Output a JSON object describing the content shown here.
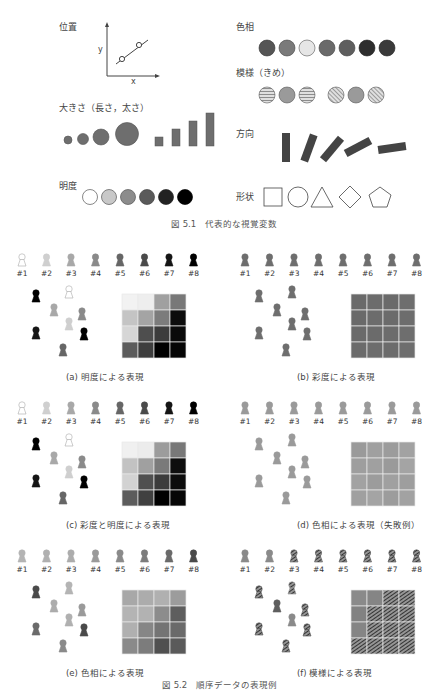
{
  "figure1": {
    "caption": "図 5.1　代表的な視覚変数",
    "labels": {
      "position": "位置",
      "size": "大きさ（長さ，太さ）",
      "lightness": "明度",
      "hue": "色相",
      "texture": "模様（きめ）",
      "orientation": "方向",
      "shape": "形状"
    },
    "axis": {
      "x": "x",
      "y": "y"
    },
    "hue_colors": [
      "#555555",
      "#7a7a7a",
      "#e6e6e6",
      "#6a6a6a",
      "#5e5e5e",
      "#2e2e2e",
      "#3a3a3a"
    ],
    "lightness_colors": [
      "#ffffff",
      "#c8c8c8",
      "#8c8c8c",
      "#5a5a5a",
      "#222222",
      "#000000"
    ]
  },
  "figure2": {
    "caption": "図 5.2　順序データの表現例",
    "ids": [
      "#1",
      "#2",
      "#3",
      "#4",
      "#5",
      "#6",
      "#7",
      "#8"
    ],
    "panels": [
      {
        "caption": "(a) 明度による表現",
        "icon_colors": [
          "#ffffff",
          "#cfcfcf",
          "#a8a8a8",
          "#8a8a8a",
          "#666666",
          "#4a4a4a",
          "#151515",
          "#000000"
        ],
        "grid": [
          "#f2f2f2",
          "#eeeeee",
          "#a0a0a0",
          "#787878",
          "#c4c4c4",
          "#a4a4a4",
          "#7c7c7c",
          "#0c0c0c",
          "#d6d6d6",
          "#4e4e4e",
          "#3c3c3c",
          "#0a0a0a",
          "#5c5c5c",
          "#3e3e3e",
          "#000000",
          "#050505"
        ]
      },
      {
        "caption": "(b) 彩度による表現",
        "icon_colors": [
          "#6e6e6e",
          "#6e6e6e",
          "#6e6e6e",
          "#6e6e6e",
          "#6e6e6e",
          "#6e6e6e",
          "#6e6e6e",
          "#6e6e6e"
        ],
        "grid": [
          "#6a6a6a",
          "#6c6c6c",
          "#6a6a6a",
          "#6e6e6e",
          "#6a6a6a",
          "#6c6c6c",
          "#6b6b6b",
          "#6d6d6d",
          "#6a6a6a",
          "#6b6b6b",
          "#6c6c6c",
          "#6e6e6e",
          "#6b6b6b",
          "#6d6d6d",
          "#6c6c6c",
          "#6e6e6e"
        ]
      },
      {
        "caption": "(c) 彩度と明度による表現",
        "icon_colors": [
          "#ffffff",
          "#cfcfcf",
          "#a8a8a8",
          "#8a8a8a",
          "#666666",
          "#4a4a4a",
          "#151515",
          "#000000"
        ],
        "grid": [
          "#f0f0f0",
          "#ececec",
          "#9c9c9c",
          "#787878",
          "#c2c2c2",
          "#a0a0a0",
          "#7a7a7a",
          "#0e0e0e",
          "#d2d2d2",
          "#505050",
          "#3c3c3c",
          "#0c0c0c",
          "#5c5c5c",
          "#404040",
          "#000000",
          "#060606"
        ]
      },
      {
        "caption": "(d) 色相による表現（失敗例）",
        "icon_colors": [
          "#9a9a9a",
          "#9a9a9a",
          "#9a9a9a",
          "#9a9a9a",
          "#9a9a9a",
          "#9a9a9a",
          "#9a9a9a",
          "#9a9a9a"
        ],
        "grid": [
          "#9a9a9a",
          "#a0a0a0",
          "#9c9c9c",
          "#a2a2a2",
          "#9e9e9e",
          "#a0a0a0",
          "#9a9a9a",
          "#a4a4a4",
          "#a2a2a2",
          "#9c9c9c",
          "#a0a0a0",
          "#9e9e9e",
          "#a0a0a0",
          "#a4a4a4",
          "#9c9c9c",
          "#a2a2a2"
        ]
      },
      {
        "caption": "(e) 色相による表現",
        "icon_colors": [
          "#b4b4b4",
          "#b0b0b0",
          "#acacac",
          "#9a9a9a",
          "#8a8a8a",
          "#7c7c7c",
          "#6a6a6a",
          "#4a4a4a"
        ],
        "grid": [
          "#a8a8a8",
          "#acacac",
          "#b0b0b0",
          "#9c9c9c",
          "#b4b4b4",
          "#b2b2b2",
          "#8c8c8c",
          "#5e5e5e",
          "#b0b0b0",
          "#868686",
          "#747474",
          "#6a6a6a",
          "#8a8a8a",
          "#7c7c7c",
          "#505050",
          "#5a5a5a"
        ]
      },
      {
        "caption": "(f) 模様による表現",
        "icon_colors": [
          "#8a8a8a",
          "#8a8a8a",
          "#5e5e5e",
          "#5a5a5a",
          "#555555",
          "#505050",
          "#4c4c4c",
          "#484848"
        ],
        "grid": [
          "#8a8a8a",
          "#858585",
          "#5e5e5e",
          "#555555",
          "#828282",
          "#5c5c5c",
          "#545454",
          "#4a4a4a",
          "#858585",
          "#555555",
          "#505050",
          "#4a4a4a",
          "#4c4c4c",
          "#484848",
          "#484848",
          "#444444"
        ]
      }
    ]
  }
}
